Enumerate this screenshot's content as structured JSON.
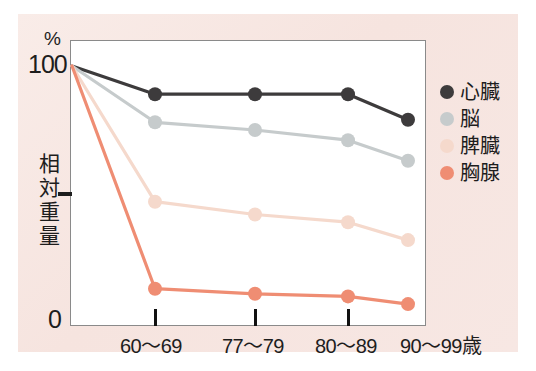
{
  "figure": {
    "panel_background": "#f7e6e2",
    "plot_background": "#ffffff",
    "frame_color": "#8a8a8a"
  },
  "axes": {
    "y_unit_label": "%",
    "y_top_tick_label": "100",
    "y_bottom_tick_label": "0",
    "y_axis_title_chars": [
      "相",
      "対",
      "重",
      "量"
    ],
    "y_axis_title": "相対重量",
    "x_tick_labels": [
      "60〜69",
      "77〜79",
      "80〜89",
      "90〜99歳"
    ]
  },
  "legend": {
    "items": [
      {
        "label": "心臓",
        "color": "#3d3b3c",
        "marker": "circle-marker"
      },
      {
        "label": "脳",
        "color": "#c6cbcc",
        "marker": "circle-marker"
      },
      {
        "label": "脾臓",
        "color": "#f5d9cc",
        "marker": "circle-marker"
      },
      {
        "label": "胸腺",
        "color": "#ef8d73",
        "marker": "circle-marker"
      }
    ]
  },
  "chart_data": {
    "type": "line",
    "title": "",
    "xlabel": "",
    "ylabel": "相対重量",
    "y_unit": "%",
    "categories": [
      "基準",
      "60〜69",
      "77〜79",
      "80〜89",
      "90〜99歳"
    ],
    "x_tick_labels": [
      "60〜69",
      "77〜79",
      "80〜89",
      "90〜99歳"
    ],
    "ylim": [
      0,
      100
    ],
    "yticks": [
      0,
      50,
      100
    ],
    "ytick_labels": [
      "0",
      "",
      "100"
    ],
    "grid": false,
    "legend_position": "right",
    "series": [
      {
        "name": "心臓",
        "color": "#3d3b3c",
        "values": [
          100,
          89,
          89,
          89,
          79
        ]
      },
      {
        "name": "脳",
        "color": "#c6cbcc",
        "values": [
          100,
          78,
          75,
          71,
          63
        ]
      },
      {
        "name": "脾臓",
        "color": "#f5d9cc",
        "values": [
          100,
          47,
          42,
          39,
          32
        ]
      },
      {
        "name": "胸腺",
        "color": "#ef8d73",
        "values": [
          100,
          13,
          11,
          10,
          7
        ]
      }
    ]
  }
}
